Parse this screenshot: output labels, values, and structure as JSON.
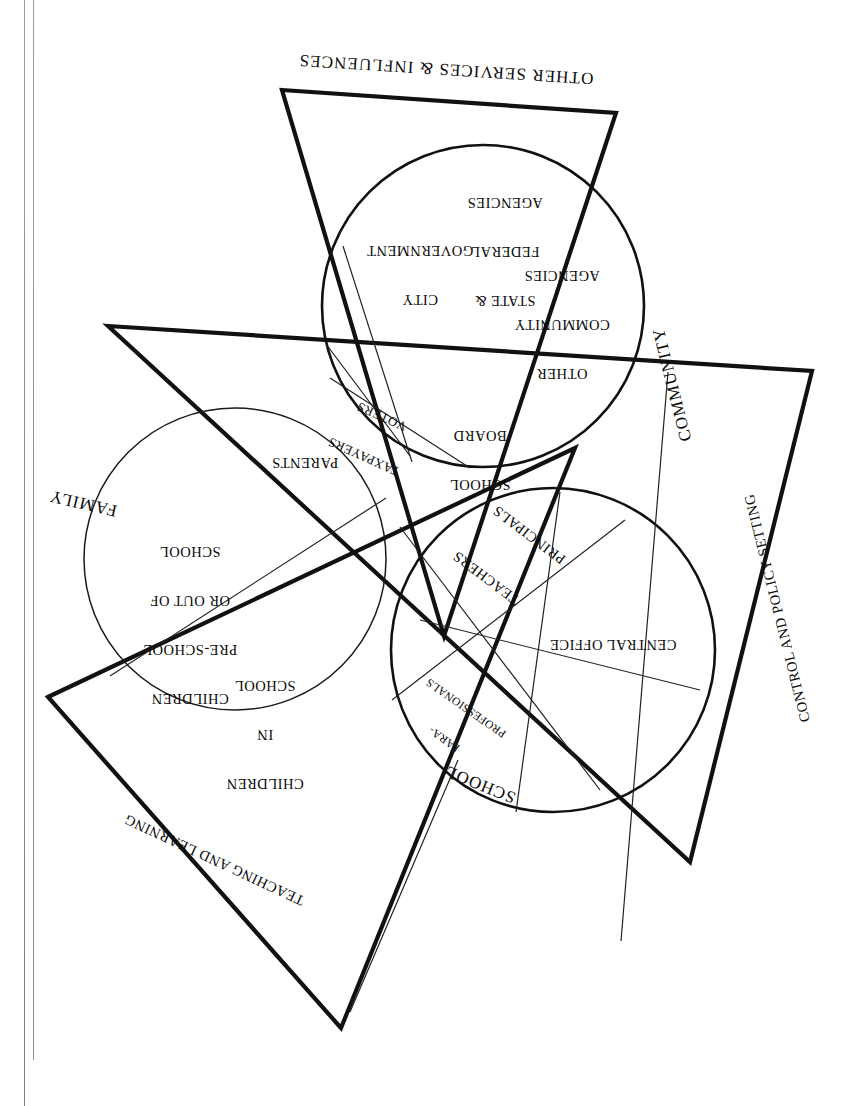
{
  "figure": {
    "orientation": "rotated-180",
    "domains": [
      {
        "id": "family",
        "label": "FAMILY",
        "type": "circle"
      },
      {
        "id": "community",
        "label": "COMMUNITY",
        "type": "circle"
      },
      {
        "id": "school",
        "label": "SCHOOL",
        "type": "circle"
      }
    ],
    "function_triangles": [
      {
        "id": "other-services",
        "label": "OTHER SERVICES & INFLUENCES"
      },
      {
        "id": "control-policy",
        "label": "CONTROL AND POLICY SETTING"
      },
      {
        "id": "teaching",
        "label": "TEACHING AND LEARNING"
      }
    ],
    "family_segments": [
      {
        "id": "children-preschool",
        "lines": [
          "CHILDREN",
          "PRE-SCHOOL",
          "OR OUT OF",
          "SCHOOL"
        ]
      },
      {
        "id": "children-in-school",
        "lines": [
          "CHILDREN",
          "IN",
          "SCHOOL"
        ]
      },
      {
        "id": "parents",
        "lines": [
          "PARENTS"
        ]
      }
    ],
    "community_segments": [
      {
        "id": "city-government",
        "lines": [
          "CITY",
          "GOVERNMENT"
        ]
      },
      {
        "id": "state-federal",
        "lines": [
          "STATE &",
          "FEDERAL",
          "AGENCIES"
        ]
      },
      {
        "id": "other-community",
        "lines": [
          "OTHER",
          "COMMUNITY",
          "AGENCIES"
        ]
      },
      {
        "id": "school-board",
        "lines": [
          "SCHOOL",
          "BOARD"
        ]
      },
      {
        "id": "taxpayers-voters",
        "lines": [
          "TAXPAYERS",
          "VOTERS"
        ]
      }
    ],
    "school_segments": [
      {
        "id": "teachers",
        "lines": [
          "TEACHERS"
        ]
      },
      {
        "id": "principals",
        "lines": [
          "PRINCIPALS"
        ]
      },
      {
        "id": "para-professionals",
        "lines": [
          "PARA-",
          "PROFESSIONALS"
        ]
      },
      {
        "id": "central-office",
        "lines": [
          "CENTRAL OFFICE"
        ]
      }
    ],
    "colors": {
      "ink": "#111111",
      "paper": "#ffffff",
      "binding": "#8a8a8a"
    }
  },
  "labels": {
    "other_services": "OTHER SERVICES & INFLUENCES",
    "control_policy": "CONTROL AND POLICY SETTING",
    "teaching_learning": "TEACHING AND LEARNING",
    "family": "FAMILY",
    "community": "COMMUNITY",
    "school": "SCHOOL",
    "city_government_1": "CITY",
    "city_government_2": "GOVERNMENT",
    "state_federal_1": "STATE &",
    "state_federal_2": "FEDERAL",
    "state_federal_3": "AGENCIES",
    "other_community_1": "OTHER",
    "other_community_2": "COMMUNITY",
    "other_community_3": "AGENCIES",
    "school_board_1": "SCHOOL",
    "school_board_2": "BOARD",
    "taxpayers": "TAXPAYERS",
    "voters": "VOTERS",
    "parents": "PARENTS",
    "children_pre_1": "CHILDREN",
    "children_pre_2": "PRE-SCHOOL",
    "children_pre_3": "OR OUT OF",
    "children_pre_4": "SCHOOL",
    "children_in_1": "CHILDREN",
    "children_in_2": "IN",
    "children_in_3": "SCHOOL",
    "teachers": "TEACHERS",
    "principals": "PRINCIPALS",
    "para_1": "PARA-",
    "para_2": "PROFESSIONALS",
    "central_office": "CENTRAL OFFICE"
  }
}
